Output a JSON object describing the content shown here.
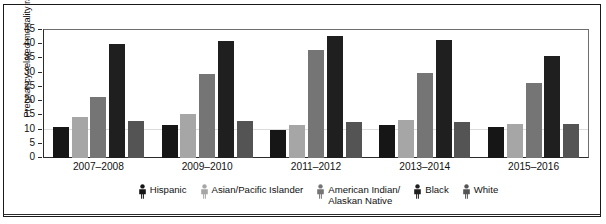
{
  "chart_data": {
    "type": "bar",
    "title": "",
    "xlabel": "",
    "ylabel": "Pregnancy-related mortality ratio",
    "ylim": [
      0,
      45
    ],
    "yticks": [
      45,
      40,
      35,
      30,
      25,
      20,
      15,
      10,
      5,
      0
    ],
    "grid": true,
    "legend_position": "bottom",
    "categories": [
      "2007–2008",
      "2009–2010",
      "2011–2012",
      "2013–2014",
      "2015–2016"
    ],
    "series": [
      {
        "name": "Hispanic",
        "icon": "person-figure-icon",
        "color": "#161616",
        "values": [
          11,
          11.5,
          10,
          11.5,
          11
        ]
      },
      {
        "name": "Asian/Pacific Islander",
        "icon": "person-figure-icon",
        "color": "#a6a6a6",
        "values": [
          14.5,
          15.5,
          11.5,
          13.5,
          12
        ]
      },
      {
        "name": "American Indian/\nAlaskan Native",
        "icon": "person-figure-icon",
        "color": "#757575",
        "values": [
          21.5,
          29.5,
          38,
          30,
          26.5
        ]
      },
      {
        "name": "Black",
        "icon": "person-figure-icon",
        "color": "#1f1f1f",
        "values": [
          40,
          41,
          43,
          41.5,
          36
        ]
      },
      {
        "name": "White",
        "icon": "person-figure-icon",
        "color": "#545454",
        "values": [
          13,
          13,
          12.5,
          12.5,
          12
        ]
      }
    ]
  }
}
